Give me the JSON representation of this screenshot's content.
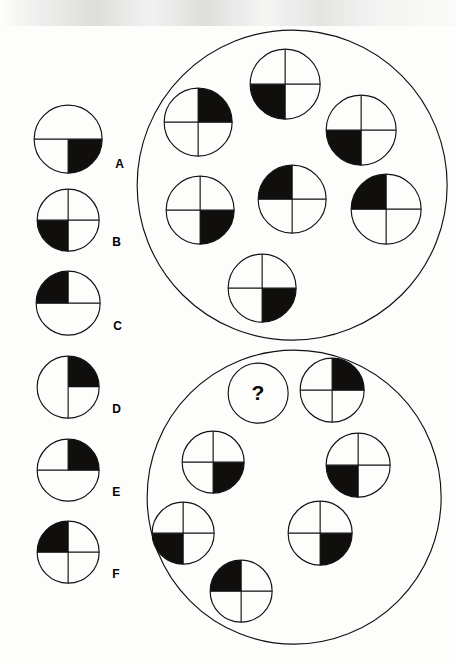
{
  "page": {
    "background_color": "#fdfdfc",
    "ink_color": "#111111",
    "shade_color": "#100f0d",
    "width": 456,
    "height": 665
  },
  "options": {
    "section_name": "answer-options",
    "items": [
      {
        "label": "A",
        "shaded_quadrant": "bottom-right",
        "has_top_vertical_line": false,
        "has_bottom_vertical_line": true,
        "has_horizontal_line": true,
        "cx": 68,
        "cy": 139,
        "r": 34
      },
      {
        "label": "B",
        "shaded_quadrant": "bottom-left",
        "has_top_vertical_line": true,
        "has_bottom_vertical_line": true,
        "has_horizontal_line": true,
        "cx": 68,
        "cy": 220,
        "r": 31
      },
      {
        "label": "C",
        "shaded_quadrant": "top-left",
        "has_top_vertical_line": true,
        "has_bottom_vertical_line": false,
        "has_horizontal_line": true,
        "cx": 68,
        "cy": 303,
        "r": 32
      },
      {
        "label": "D",
        "shaded_quadrant": "top-right",
        "has_top_vertical_line": true,
        "has_bottom_vertical_line": true,
        "has_horizontal_line": false,
        "cx": 68,
        "cy": 387,
        "r": 31
      },
      {
        "label": "E",
        "shaded_quadrant": "top-right",
        "has_top_vertical_line": true,
        "has_bottom_vertical_line": false,
        "has_horizontal_line": true,
        "cx": 68,
        "cy": 470,
        "r": 31
      },
      {
        "label": "F",
        "shaded_quadrant": "top-left",
        "has_top_vertical_line": true,
        "has_bottom_vertical_line": true,
        "has_horizontal_line": true,
        "cx": 68,
        "cy": 552,
        "r": 31
      }
    ]
  },
  "groups": [
    {
      "name": "top-group",
      "cx": 292,
      "cy": 185,
      "r": 155,
      "members": [
        {
          "position": "top-center",
          "shaded_quadrant": "bottom-left",
          "cx": 285,
          "cy": 84,
          "r": 35
        },
        {
          "position": "upper-left",
          "shaded_quadrant": "top-right",
          "cx": 198,
          "cy": 122,
          "r": 34
        },
        {
          "position": "upper-right",
          "shaded_quadrant": "bottom-left",
          "cx": 361,
          "cy": 130,
          "r": 35
        },
        {
          "position": "center",
          "shaded_quadrant": "top-left",
          "cx": 292,
          "cy": 199,
          "r": 34
        },
        {
          "position": "mid-left",
          "shaded_quadrant": "bottom-right",
          "cx": 200,
          "cy": 210,
          "r": 34
        },
        {
          "position": "mid-right",
          "shaded_quadrant": "top-left",
          "cx": 386,
          "cy": 209,
          "r": 35
        },
        {
          "position": "bottom",
          "shaded_quadrant": "bottom-right",
          "cx": 262,
          "cy": 288,
          "r": 34
        }
      ]
    },
    {
      "name": "bottom-group",
      "cx": 294,
      "cy": 497,
      "r": 147,
      "members": [
        {
          "position": "top-left",
          "shaded_quadrant": "question",
          "cx": 258,
          "cy": 393,
          "r": 30
        },
        {
          "position": "top-right",
          "shaded_quadrant": "top-right",
          "cx": 332,
          "cy": 390,
          "r": 32
        },
        {
          "position": "mid-left",
          "shaded_quadrant": "bottom-right",
          "cx": 213,
          "cy": 462,
          "r": 31
        },
        {
          "position": "mid-right",
          "shaded_quadrant": "bottom-left",
          "cx": 358,
          "cy": 465,
          "r": 32
        },
        {
          "position": "lower-left",
          "shaded_quadrant": "bottom-left",
          "cx": 183,
          "cy": 533,
          "r": 31
        },
        {
          "position": "lower-right",
          "shaded_quadrant": "bottom-right",
          "cx": 320,
          "cy": 533,
          "r": 32
        },
        {
          "position": "bottom",
          "shaded_quadrant": "top-left",
          "cx": 241,
          "cy": 591,
          "r": 31
        }
      ]
    }
  ],
  "question_marker": {
    "glyph": "?",
    "name": "question-mark-placeholder"
  }
}
